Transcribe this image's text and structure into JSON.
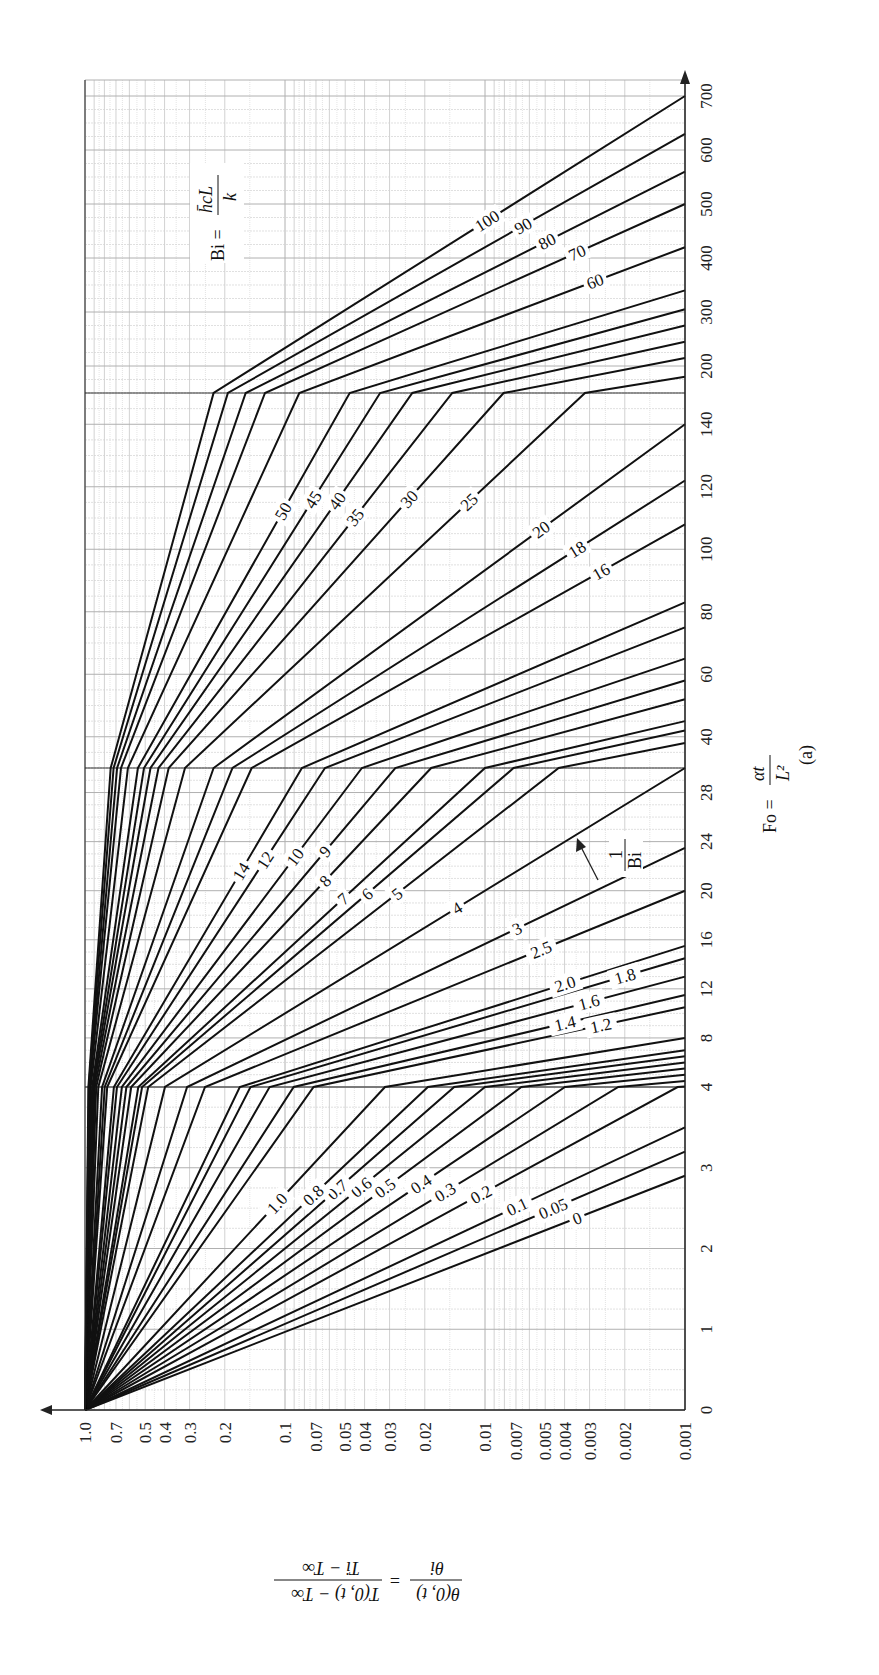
{
  "chart_data": {
    "type": "line",
    "orientation": "rotated-90-clockwise",
    "title": "",
    "caption": "(a)",
    "xlabel": "Fo = αt / L²",
    "ylabel": "θ(0,t)/θi = (T(0,t) − T∞)/(Ti − T∞)",
    "parameter_label": "Bi = h̄c L / k",
    "parameter_arrow_label": "1/Bi",
    "x_axis": {
      "name": "Fo",
      "scale": "piecewise-linear",
      "segments": [
        [
          0,
          4
        ],
        [
          4,
          30
        ],
        [
          30,
          150
        ],
        [
          150,
          700
        ]
      ],
      "ticks": [
        0,
        1,
        2,
        3,
        4,
        8,
        12,
        16,
        20,
        24,
        28,
        40,
        60,
        80,
        100,
        120,
        140,
        200,
        300,
        400,
        500,
        600,
        700
      ]
    },
    "y_axis": {
      "name": "theta_ratio",
      "scale": "log",
      "range": [
        0.001,
        1.0
      ],
      "ticks": [
        "1.0",
        "0.7",
        "0.5",
        "0.4",
        "0.3",
        "0.2",
        "0.1",
        "0.07",
        "0.05",
        "0.04",
        "0.03",
        "0.02",
        "0.01",
        "0.007",
        "0.005",
        "0.004",
        "0.003",
        "0.002",
        "0.001"
      ]
    },
    "series_note": "Each series is a straight line on the log(θ) vs Fo plot, starting at θ=1 at Fo=0. The parameter is 1/Bi, and each curve reaches θ=0.001 at the listed Fo value.",
    "series": [
      {
        "name": "0",
        "fo_at_0001": 2.9
      },
      {
        "name": "0.05",
        "fo_at_0001": 3.2
      },
      {
        "name": "0.1",
        "fo_at_0001": 3.5
      },
      {
        "name": "0.2",
        "fo_at_0001": 4.05
      },
      {
        "name": "0.3",
        "fo_at_0001": 4.5
      },
      {
        "name": "0.4",
        "fo_at_0001": 5.0
      },
      {
        "name": "0.5",
        "fo_at_0001": 5.5
      },
      {
        "name": "0.6",
        "fo_at_0001": 6.0
      },
      {
        "name": "0.7",
        "fo_at_0001": 6.5
      },
      {
        "name": "0.8",
        "fo_at_0001": 7.0
      },
      {
        "name": "1.0",
        "fo_at_0001": 8.0
      },
      {
        "name": "1.2",
        "fo_at_0001": 10.5
      },
      {
        "name": "1.4",
        "fo_at_0001": 11.5
      },
      {
        "name": "1.6",
        "fo_at_0001": 13.0
      },
      {
        "name": "1.8",
        "fo_at_0001": 14.5
      },
      {
        "name": "2.0",
        "fo_at_0001": 15.5
      },
      {
        "name": "2.5",
        "fo_at_0001": 20.0
      },
      {
        "name": "3",
        "fo_at_0001": 23.5
      },
      {
        "name": "4",
        "fo_at_0001": 30.0
      },
      {
        "name": "5",
        "fo_at_0001": 38.0
      },
      {
        "name": "6",
        "fo_at_0001": 42.0
      },
      {
        "name": "7",
        "fo_at_0001": 45.0
      },
      {
        "name": "8",
        "fo_at_0001": 52.0
      },
      {
        "name": "9",
        "fo_at_0001": 58.0
      },
      {
        "name": "10",
        "fo_at_0001": 65.0
      },
      {
        "name": "12",
        "fo_at_0001": 75.0
      },
      {
        "name": "14",
        "fo_at_0001": 83.0
      },
      {
        "name": "16",
        "fo_at_0001": 108.0
      },
      {
        "name": "18",
        "fo_at_0001": 122.0
      },
      {
        "name": "20",
        "fo_at_0001": 140.0
      },
      {
        "name": "25",
        "fo_at_0001": 180.0
      },
      {
        "name": "30",
        "fo_at_0001": 215.0
      },
      {
        "name": "35",
        "fo_at_0001": 245.0
      },
      {
        "name": "40",
        "fo_at_0001": 275.0
      },
      {
        "name": "45",
        "fo_at_0001": 305.0
      },
      {
        "name": "50",
        "fo_at_0001": 340.0
      },
      {
        "name": "60",
        "fo_at_0001": 420.0
      },
      {
        "name": "70",
        "fo_at_0001": 500.0
      },
      {
        "name": "80",
        "fo_at_0001": 560.0
      },
      {
        "name": "90",
        "fo_at_0001": 630.0
      },
      {
        "name": "100",
        "fo_at_0001": 700.0
      }
    ],
    "labeled_curves": [
      "0",
      "0.05",
      "0.1",
      "0.2",
      "0.3",
      "0.4",
      "0.5",
      "0.6",
      "0.7",
      "0.8",
      "1.0",
      "1.2",
      "1.4",
      "1.6",
      "1.8",
      "2.0",
      "2.5",
      "3",
      "4",
      "5",
      "6",
      "7",
      "8",
      "9",
      "10",
      "12",
      "14",
      "16",
      "18",
      "20",
      "25",
      "30",
      "35",
      "40",
      "45",
      "50",
      "60",
      "70",
      "80",
      "90",
      "100"
    ],
    "grid": true,
    "legend": "none"
  },
  "labels": {
    "ylabel_numerator_left": "θ(0, t)",
    "ylabel_denominator_left": "θi",
    "ylabel_equals": "=",
    "ylabel_numerator_right": "T(0, t) − T∞",
    "ylabel_denominator_right": "Ti − T∞",
    "xlabel_left": "Fo =",
    "xlabel_numerator": "αt",
    "xlabel_denominator": "L²",
    "caption": "(a)",
    "bi_left": "Bi =",
    "bi_numerator": "h̄cL",
    "bi_denominator": "k",
    "inv_bi_num": "1",
    "inv_bi_den": "Bi"
  },
  "colors": {
    "curve": "#111111",
    "grid_major": "#b0b0b0",
    "grid_minor": "#d2d2d2",
    "axis": "#222222",
    "background": "#ffffff"
  }
}
